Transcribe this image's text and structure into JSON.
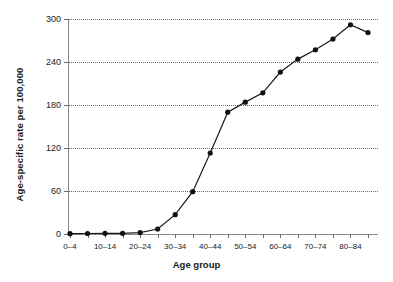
{
  "chart_data": {
    "type": "line",
    "title": "",
    "xlabel": "Age group",
    "ylabel": "Age-specific rate per 100,000",
    "ylim": [
      0,
      300
    ],
    "yticks": [
      0,
      60,
      120,
      180,
      240,
      300
    ],
    "grid": "horizontal-dotted",
    "legend": "none",
    "categories": [
      "0–4",
      "5–9",
      "10–14",
      "15–19",
      "20–24",
      "25–29",
      "30–34",
      "35–39",
      "40–44",
      "45–49",
      "50–54",
      "55–59",
      "60–64",
      "65–69",
      "70–74",
      "75–79",
      "80–84",
      "85+"
    ],
    "visible_tick_labels": [
      "0–4",
      "10–14",
      "20–24",
      "30–34",
      "40–44",
      "50–54",
      "60–64",
      "70–74",
      "80–84"
    ],
    "values": [
      0.5,
      0.7,
      0.9,
      1.0,
      2.0,
      7.0,
      27.0,
      59.0,
      113.0,
      170.0,
      184.0,
      197.0,
      226.0,
      244.0,
      257.0,
      272.0,
      292.0,
      281.0
    ],
    "marker": "filled-circle",
    "line_color": "#1a1a1a",
    "marker_color": "#111111"
  }
}
